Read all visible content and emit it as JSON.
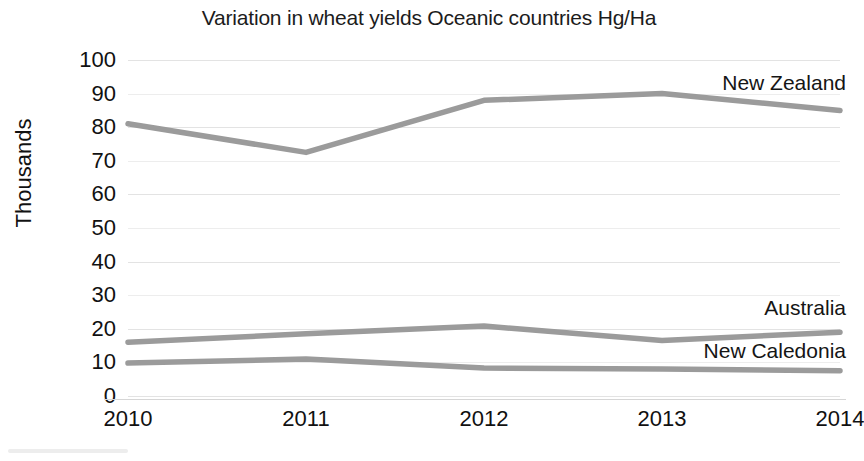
{
  "chart_data": {
    "type": "line",
    "title": "Variation in wheat yields Oceanic countries Hg/Ha",
    "xlabel": "",
    "ylabel": "Thousands",
    "categories": [
      "2010",
      "2011",
      "2012",
      "2013",
      "2014"
    ],
    "x": [
      2010,
      2011,
      2012,
      2013,
      2014
    ],
    "ylim": [
      0,
      100
    ],
    "xlim": [
      2010,
      2014
    ],
    "yticks": [
      0,
      10,
      20,
      30,
      40,
      50,
      60,
      70,
      80,
      90,
      100
    ],
    "ytick_labels": [
      "0",
      "10",
      "20",
      "30",
      "40",
      "50",
      "60",
      "70",
      "80",
      "90",
      "100"
    ],
    "grid": true,
    "legend_position": "inline-right-of-series",
    "series": [
      {
        "name": "New Zealand",
        "color": "#9b9b9b",
        "values": [
          81,
          72.5,
          88,
          90,
          85
        ],
        "label_x": 2014,
        "label_y": 93
      },
      {
        "name": "Australia",
        "color": "#9b9b9b",
        "values": [
          16,
          18.5,
          20.8,
          16.5,
          19
        ],
        "label_x": 2014,
        "label_y": 26
      },
      {
        "name": "New Caledonia",
        "color": "#9b9b9b",
        "values": [
          9.8,
          11,
          8.3,
          8,
          7.5
        ],
        "label_x": 2014,
        "label_y": 13
      }
    ]
  },
  "chart": {
    "title": "Variation in wheat yields Oceanic countries Hg/Ha",
    "y_axis_title": "Thousands",
    "y_tick_labels": [
      "100",
      "90",
      "80",
      "70",
      "60",
      "50",
      "40",
      "30",
      "20",
      "10",
      "0"
    ],
    "x_tick_labels": [
      "2010",
      "2011",
      "2012",
      "2013",
      "2014"
    ],
    "series_labels": [
      "New Zealand",
      "Australia",
      "New Caledonia"
    ],
    "line_color": "#9b9b9b",
    "gridline_color": "#e3e3e3",
    "text_color": "#111111",
    "background_color": "#ffffff"
  }
}
